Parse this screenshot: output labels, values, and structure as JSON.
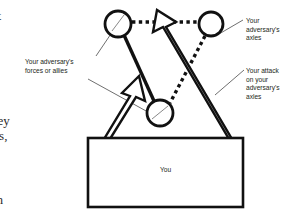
{
  "figure": {
    "box": {
      "label": "You"
    },
    "labels": {
      "adversary_forces": "Your  adversary's\nforces or allies",
      "adversary_axles": "Your\nadversary's\naxles",
      "your_attack": "Your attack\non your\nadversary's\naxles"
    },
    "page_text_fragments": {
      "frag_1": "lt",
      "frag_2": "key",
      "frag_3": "res,",
      "frag_4": "m"
    },
    "colors": {
      "ink": "#1a1a1a",
      "text": "#231f20",
      "page_text": "#2b2b2b",
      "background": "#ffffff"
    },
    "nodes": [
      {
        "name": "adversary-node-top-left",
        "cx": 118,
        "cy": 24,
        "r": 13
      },
      {
        "name": "adversary-node-top-right",
        "cx": 211,
        "cy": 24,
        "r": 12
      },
      {
        "name": "adversary-node-middle",
        "cx": 160,
        "cy": 113,
        "r": 13
      }
    ]
  }
}
